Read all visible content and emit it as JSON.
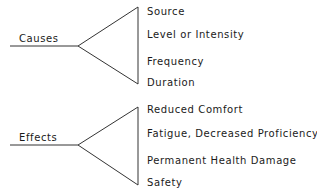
{
  "groups": [
    {
      "label": "Causes",
      "items": [
        "Source",
        "Level or Intensity",
        "Frequency",
        "Duration"
      ]
    },
    {
      "label": "Effects",
      "items": [
        "Reduced Comfort",
        "Fatigue, Decreased Proficiency",
        "Permanent Health Damage",
        "Safety"
      ]
    }
  ],
  "colors": {
    "line": "#333333",
    "text": "#1a1a1a",
    "background": "#ffffff"
  }
}
